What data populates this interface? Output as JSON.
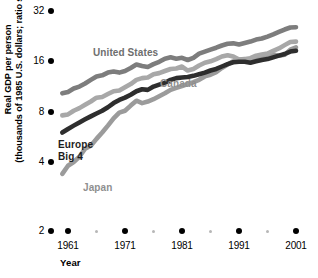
{
  "chart_data": {
    "type": "line",
    "title": "",
    "xlabel": "Year",
    "ylabel_line1": "Real GDP per person",
    "ylabel_line2": "(thousands of 1985 U.S. dollars; ratio scale)",
    "scale": "log2 (ratio scale)",
    "ylim": [
      2,
      32
    ],
    "yticks": [
      32,
      16,
      8,
      4,
      2
    ],
    "ytick_labels": [
      "32",
      "16",
      "8",
      "4",
      "2"
    ],
    "xlim": [
      1960,
      2001
    ],
    "xticks": [
      1961,
      1971,
      1981,
      1991,
      2001
    ],
    "xtick_labels": [
      "1961",
      "1971",
      "1981",
      "1991",
      "2001"
    ],
    "xminor_ticks": [
      1966,
      1976,
      1986,
      1996
    ],
    "grid": false,
    "legend_position": "inline-annotations",
    "colors": {
      "united_states": "#7d7d7d",
      "canada": "#a8a8a8",
      "europe_big_4": "#2e2e2e",
      "japan": "#9b9b9b"
    },
    "series": [
      {
        "name": "United States",
        "label": "United States",
        "color": "#7d7d7d",
        "x": [
          1960,
          1961,
          1962,
          1963,
          1964,
          1965,
          1966,
          1967,
          1968,
          1969,
          1970,
          1971,
          1972,
          1973,
          1974,
          1975,
          1976,
          1977,
          1978,
          1979,
          1980,
          1981,
          1982,
          1983,
          1984,
          1985,
          1986,
          1987,
          1988,
          1989,
          1990,
          1991,
          1992,
          1993,
          1994,
          1995,
          1996,
          1997,
          1998,
          1999,
          2000,
          2001
        ],
        "values": [
          10.3,
          10.5,
          11.0,
          11.3,
          11.8,
          12.4,
          13.0,
          13.2,
          13.7,
          13.9,
          13.7,
          14.0,
          14.6,
          15.3,
          15.0,
          14.8,
          15.4,
          15.9,
          16.6,
          16.9,
          16.6,
          16.8,
          16.3,
          16.8,
          17.8,
          18.3,
          18.8,
          19.3,
          19.9,
          20.4,
          20.5,
          20.2,
          20.6,
          21.0,
          21.6,
          21.9,
          22.5,
          23.2,
          24.0,
          24.8,
          25.5,
          25.6
        ]
      },
      {
        "name": "Canada",
        "label": "Canada",
        "color": "#a8a8a8",
        "x": [
          1960,
          1961,
          1962,
          1963,
          1964,
          1965,
          1966,
          1967,
          1968,
          1969,
          1970,
          1971,
          1972,
          1973,
          1974,
          1975,
          1976,
          1977,
          1978,
          1979,
          1980,
          1981,
          1982,
          1983,
          1984,
          1985,
          1986,
          1987,
          1988,
          1989,
          1990,
          1991,
          1992,
          1993,
          1994,
          1995,
          1996,
          1997,
          1998,
          1999,
          2000,
          2001
        ],
        "values": [
          7.6,
          7.7,
          8.1,
          8.4,
          8.8,
          9.2,
          9.7,
          9.8,
          10.2,
          10.6,
          10.7,
          11.2,
          11.7,
          12.4,
          12.7,
          12.8,
          13.4,
          13.6,
          14.0,
          14.4,
          14.5,
          14.9,
          14.1,
          14.4,
          15.1,
          15.7,
          16.0,
          16.5,
          17.1,
          17.4,
          17.1,
          16.4,
          16.4,
          16.7,
          17.3,
          17.6,
          17.8,
          18.5,
          19.1,
          20.0,
          20.9,
          21.0
        ]
      },
      {
        "name": "Europe Big 4",
        "label": "Europe Big 4",
        "color": "#2e2e2e",
        "x": [
          1960,
          1961,
          1962,
          1963,
          1964,
          1965,
          1966,
          1967,
          1968,
          1969,
          1970,
          1971,
          1972,
          1973,
          1974,
          1975,
          1976,
          1977,
          1978,
          1979,
          1980,
          1981,
          1982,
          1983,
          1984,
          1985,
          1986,
          1987,
          1988,
          1989,
          1990,
          1991,
          1992,
          1993,
          1994,
          1995,
          1996,
          1997,
          1998,
          1999,
          2000,
          2001
        ],
        "values": [
          6.0,
          6.3,
          6.6,
          6.9,
          7.2,
          7.5,
          7.8,
          8.1,
          8.5,
          9.0,
          9.4,
          9.7,
          10.1,
          10.6,
          10.9,
          10.8,
          11.3,
          11.6,
          11.9,
          12.4,
          12.7,
          12.8,
          12.9,
          13.1,
          13.4,
          13.7,
          14.1,
          14.4,
          14.9,
          15.4,
          15.8,
          15.9,
          15.9,
          15.7,
          16.0,
          16.3,
          16.5,
          16.9,
          17.3,
          17.7,
          18.3,
          18.5
        ]
      },
      {
        "name": "Japan",
        "label": "Japan",
        "color": "#9b9b9b",
        "x": [
          1960,
          1961,
          1962,
          1963,
          1964,
          1965,
          1966,
          1967,
          1968,
          1969,
          1970,
          1971,
          1972,
          1973,
          1974,
          1975,
          1976,
          1977,
          1978,
          1979,
          1980,
          1981,
          1982,
          1983,
          1984,
          1985,
          1986,
          1987,
          1988,
          1989,
          1990,
          1991,
          1992,
          1993,
          1994,
          1995,
          1996,
          1997,
          1998,
          1999,
          2000,
          2001
        ],
        "values": [
          3.4,
          3.8,
          4.0,
          4.3,
          4.8,
          5.0,
          5.5,
          6.0,
          6.6,
          7.3,
          7.9,
          8.1,
          8.7,
          9.3,
          9.0,
          9.2,
          9.5,
          9.9,
          10.3,
          10.8,
          11.1,
          11.4,
          11.7,
          12.0,
          12.4,
          13.0,
          13.3,
          13.8,
          14.6,
          15.3,
          16.0,
          16.4,
          16.5,
          16.5,
          16.7,
          17.0,
          17.4,
          17.6,
          17.3,
          17.5,
          18.8,
          19.4
        ]
      }
    ],
    "annotations": [
      {
        "text": "United States",
        "series": "United States"
      },
      {
        "text": "Canada",
        "series": "Canada"
      },
      {
        "text": "Europe Big 4",
        "series": "Europe Big 4"
      },
      {
        "text": "Japan",
        "series": "Japan"
      }
    ]
  },
  "axis": {
    "y_title_line1": "Real GDP per person",
    "y_title_line2": "(thousands of 1985 U.S. dollars; ratio scale)",
    "x_title": "Year"
  }
}
